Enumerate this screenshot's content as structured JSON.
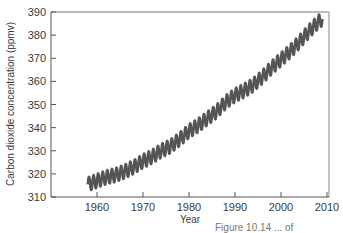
{
  "chart_data": {
    "type": "line",
    "title": "",
    "xlabel": "Year",
    "ylabel": "Carbon dioxide concentration (ppmv)",
    "xlim": [
      1950,
      2010
    ],
    "ylim": [
      310,
      390
    ],
    "xticks": [
      1960,
      1970,
      1980,
      1990,
      2000,
      2010
    ],
    "yticks": [
      310,
      320,
      330,
      340,
      350,
      360,
      370,
      380,
      390
    ],
    "grid": false,
    "legend": null,
    "series": [
      {
        "name": "Atmospheric CO2 (Mauna Loa)",
        "color": "#555555",
        "seasonal_amplitude_ppmv": 3,
        "x": [
          1958,
          1960,
          1962,
          1964,
          1966,
          1968,
          1970,
          1972,
          1974,
          1976,
          1978,
          1980,
          1982,
          1984,
          1986,
          1988,
          1990,
          1992,
          1994,
          1996,
          1998,
          2000,
          2002,
          2004,
          2006,
          2008,
          2009
        ],
        "y": [
          315.5,
          317,
          318.5,
          319.5,
          321,
          323,
          325.5,
          327.5,
          330,
          332,
          335,
          338.5,
          341,
          344,
          347,
          351,
          354,
          356,
          358.5,
          362,
          366,
          369.5,
          373,
          377,
          381.5,
          385.5,
          387
        ]
      }
    ]
  },
  "axes": {
    "x_title": "Year",
    "y_title": "Carbon dioxide concentration (ppmv)",
    "x_tick_labels": [
      "1960",
      "1970",
      "1980",
      "1990",
      "2000",
      "2010"
    ],
    "y_tick_labels": [
      "310",
      "320",
      "330",
      "340",
      "350",
      "360",
      "370",
      "380",
      "390"
    ]
  },
  "caption": "Figure 10.14 ... of"
}
